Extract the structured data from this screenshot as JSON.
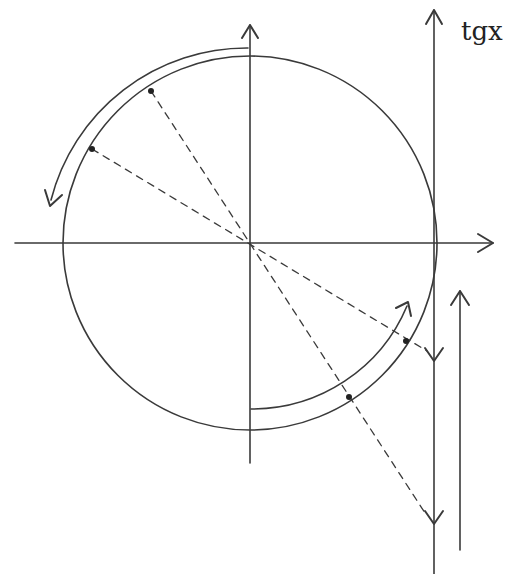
{
  "diagram": {
    "tangent_axis_label": "tgx",
    "colors": {
      "stroke": "#3a3a3a",
      "background": "#ffffff"
    },
    "elements": {
      "unit_circle": "circle centered at origin",
      "x_axis": "horizontal axis with arrow pointing right",
      "y_axis": "vertical axis with arrow pointing up",
      "tangent_line": "vertical line tangent to circle at x=1, arrow up, labeled tgx",
      "parallel_arrow": "upward arrow parallel to tangent line, lower right",
      "upper_arc_arrow": "counter-clockwise arc arrow along upper-left quadrant",
      "lower_arc_arrow": "counter-clockwise arc arrow along lower-right quadrant",
      "points_upper": 2,
      "points_lower": 2,
      "dashed_rays": 2,
      "tangent_down_arrows": 2
    }
  }
}
